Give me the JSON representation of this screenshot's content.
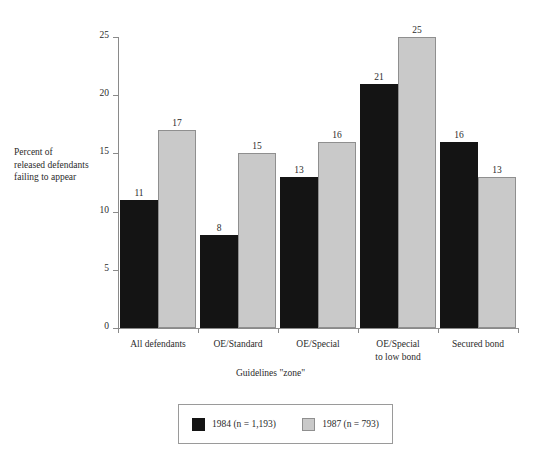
{
  "chart_data": {
    "type": "bar",
    "title": "",
    "xlabel": "Guidelines \"zone\"",
    "ylabel": "Percent of\nreleased defendants\nfailing to appear",
    "categories": [
      "All defendants",
      "OE/Standard",
      "OE/Special",
      "OE/Special\nto low bond",
      "Secured bond"
    ],
    "series": [
      {
        "name": "1984 (n = 1,193)",
        "color": "#141414",
        "values": [
          11,
          8,
          13,
          21,
          16
        ]
      },
      {
        "name": "1987 (n = 793)",
        "color": "#c9c9c9",
        "values": [
          17,
          15,
          16,
          25,
          13
        ]
      }
    ],
    "ylim": [
      0,
      25
    ],
    "yticks": [
      0,
      5,
      10,
      15,
      20,
      25
    ],
    "ytick_labels": [
      "0",
      "5",
      "10",
      "15",
      "20",
      "25"
    ],
    "grid": false,
    "legend_position": "bottom-center",
    "value_labels": true
  },
  "legend": {
    "items": [
      {
        "label": "1984 (n = 1,193)",
        "swatch": "s1984"
      },
      {
        "label": "1987 (n = 793)",
        "swatch": "s1987"
      }
    ]
  }
}
